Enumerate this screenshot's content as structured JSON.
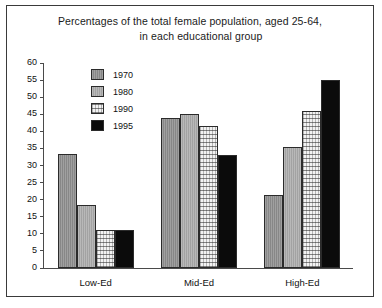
{
  "chart_data": {
    "type": "bar",
    "title": "Percentages of the total female population, aged 25-64, in each educational group",
    "title_line1": "Percentages of the total female population, aged 25-64,",
    "title_line2": "in each educational group",
    "xlabel": "",
    "ylabel": "",
    "ylim": [
      0,
      60
    ],
    "ytick_step": 5,
    "yticks": [
      60,
      55,
      50,
      45,
      40,
      35,
      30,
      25,
      20,
      15,
      10,
      5,
      0
    ],
    "grid": false,
    "legend_position": "inside-upper-left",
    "categories": [
      "Low-Ed",
      "Mid-Ed",
      "High-Ed"
    ],
    "series": [
      {
        "name": "1970",
        "color": "#8e8e8e",
        "values": [
          33.5,
          44.0,
          21.5
        ]
      },
      {
        "name": "1980",
        "color": "#a9a9a9",
        "values": [
          18.5,
          45.0,
          35.5
        ]
      },
      {
        "name": "1990",
        "color": "#f2f2f2",
        "values": [
          11.0,
          41.5,
          46.0
        ]
      },
      {
        "name": "1995",
        "color": "#0b0b0b",
        "values": [
          11.0,
          33.0,
          55.0
        ]
      }
    ]
  }
}
